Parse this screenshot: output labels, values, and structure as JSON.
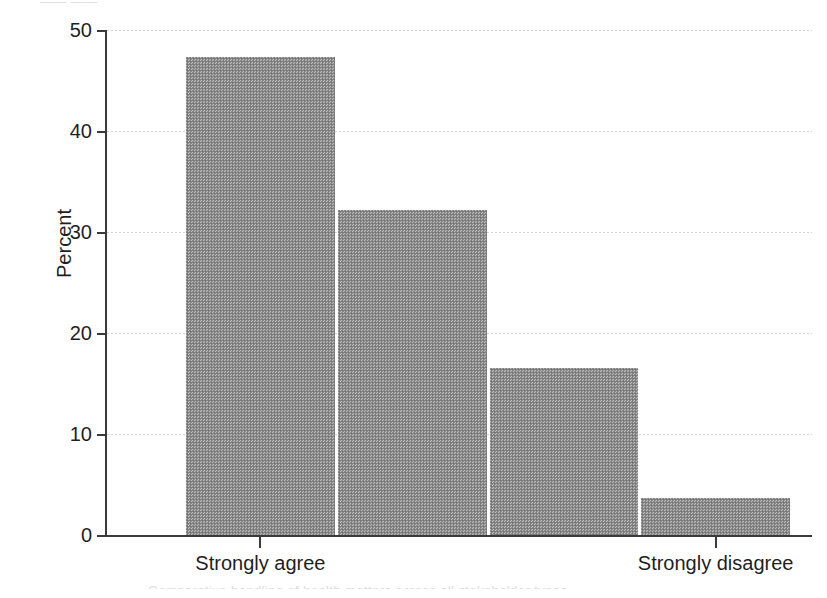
{
  "figure": {
    "scan_top_artifact": "—— ——",
    "scan_bottom_artifact": "Comparative handling of health matters across all stakeholder types"
  },
  "chart_data": {
    "type": "bar",
    "title": "",
    "subtitle": "",
    "xlabel": "",
    "ylabel": "Percent",
    "categories": [
      "Strongly agree",
      "",
      "",
      "Strongly disagree"
    ],
    "values": [
      47.3,
      32.2,
      16.5,
      3.7
    ],
    "ylim": [
      0,
      50
    ],
    "yticks": [
      0,
      10,
      20,
      30,
      40,
      50
    ],
    "ytick_labels": [
      "0",
      "10",
      "20",
      "30",
      "40",
      "50"
    ],
    "xtick_positions": [
      0,
      3
    ],
    "xtick_labels": [
      "Strongly agree",
      "Strongly disagree"
    ],
    "grid": true,
    "grid_axis": "y",
    "grid_style": "dotted",
    "legend": null,
    "legend_position": "none",
    "bar_color": "#8c8c8c",
    "bar_fill_pattern": "halftone-dither",
    "axis_color": "#3a3a3a",
    "gridline_color": "#b9b9c4",
    "bar_count": 4,
    "bar_gap_color": "#ffffff",
    "annotations": []
  }
}
